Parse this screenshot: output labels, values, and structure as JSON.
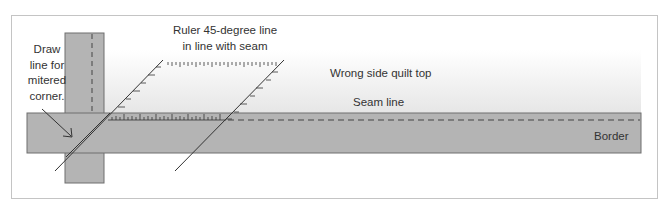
{
  "figure": {
    "type": "diagram",
    "labels": {
      "draw_line": [
        "Draw",
        "line for",
        "mitered",
        "corner."
      ],
      "ruler": [
        "Ruler 45-degree line",
        "in line with seam"
      ],
      "wrong_side": "Wrong side quilt top",
      "seam_line": "Seam line",
      "border": "Border"
    },
    "colors": {
      "fabric_gray": "#b4b4b4",
      "outline": "#6e6e6e",
      "line": "#333333",
      "quilt_top_gradient_end": "#e6e6e6",
      "frame": "#c4c4c4",
      "text": "#333333"
    }
  }
}
